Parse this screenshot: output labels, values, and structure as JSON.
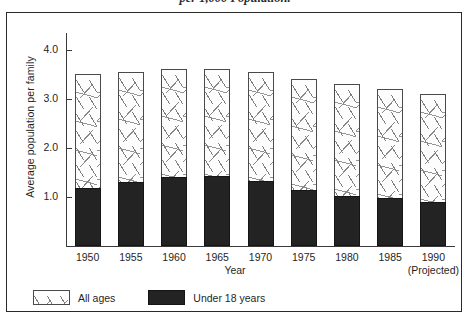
{
  "caption": "per 1,000 Population.",
  "chart_data": {
    "type": "bar",
    "subtype": "stacked-vertical",
    "title": "",
    "xlabel": "Year",
    "ylabel": "Average population per family",
    "categories": [
      "1950",
      "1955",
      "1960",
      "1965",
      "1970",
      "1975",
      "1980",
      "1985",
      "1990"
    ],
    "category_notes": [
      "",
      "",
      "",
      "",
      "",
      "",
      "",
      "",
      "(Projected)"
    ],
    "series": [
      {
        "name": "All ages",
        "fill": "hatched-speckle",
        "values": [
          3.52,
          3.55,
          3.62,
          3.62,
          3.55,
          3.4,
          3.3,
          3.2,
          3.1
        ]
      },
      {
        "name": "Under 18 years",
        "fill": "solid-black",
        "values": [
          1.18,
          1.3,
          1.4,
          1.43,
          1.33,
          1.15,
          1.03,
          0.97,
          0.9
        ]
      }
    ],
    "ylim": [
      0,
      4.3
    ],
    "yticks": [
      "1.0",
      "2.0",
      "3.0",
      "4.0"
    ],
    "ytick_values": [
      1.0,
      2.0,
      3.0,
      4.0
    ],
    "grid": false,
    "legend_position": "bottom-left"
  },
  "legend": [
    {
      "label": "All ages",
      "swatch": "pattern"
    },
    {
      "label": "Under 18 years",
      "swatch": "solid"
    }
  ],
  "colors": {
    "bar_fill": "#fdfdfd",
    "bar_border": "#4a4a4a",
    "sub_bar": "#232323",
    "axis": "#3a3a3a",
    "frame": "#2a2a2a",
    "text": "#1f1f1f"
  }
}
